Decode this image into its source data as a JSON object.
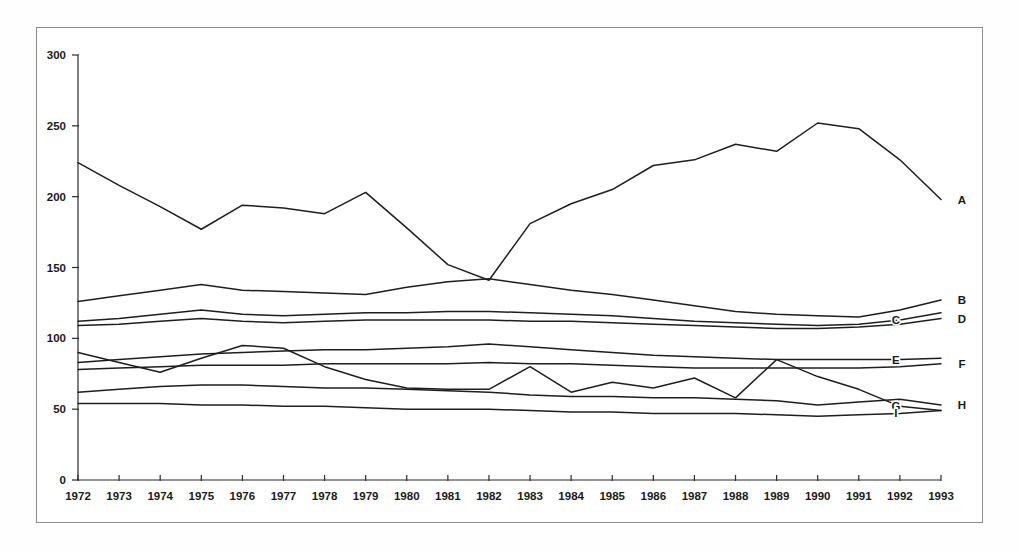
{
  "chart_data": {
    "type": "line",
    "title": "",
    "subtitle": "",
    "xlabel": "",
    "ylabel": "",
    "xlim": [
      1972,
      1993
    ],
    "ylim": [
      0,
      300
    ],
    "grid": false,
    "legend_position": "right-inline",
    "x": [
      1972,
      1973,
      1974,
      1975,
      1976,
      1977,
      1978,
      1979,
      1980,
      1981,
      1982,
      1983,
      1984,
      1985,
      1986,
      1987,
      1988,
      1989,
      1990,
      1991,
      1992,
      1993
    ],
    "xtick_labels": [
      "1972",
      "1973",
      "1974",
      "1975",
      "1976",
      "1977",
      "1978",
      "1979",
      "1980",
      "1981",
      "1982",
      "1983",
      "1984",
      "1985",
      "1986",
      "1987",
      "1988",
      "1989",
      "1990",
      "1991",
      "1992",
      "1993"
    ],
    "ytick_labels": [
      "0",
      "50",
      "100",
      "150",
      "200",
      "250",
      "300"
    ],
    "yticks": [
      0,
      50,
      100,
      150,
      200,
      250,
      300
    ],
    "series": [
      {
        "name": "A",
        "label": "A",
        "label_position": "right-outside",
        "values": [
          224,
          208,
          193,
          177,
          194,
          192,
          188,
          203,
          178,
          152,
          141,
          181,
          195,
          205,
          222,
          226,
          237,
          232,
          252,
          248,
          226,
          198
        ]
      },
      {
        "name": "B",
        "label": "B",
        "label_position": "right-outside",
        "values": [
          126,
          130,
          134,
          138,
          134,
          133,
          132,
          131,
          136,
          140,
          142,
          138,
          134,
          131,
          127,
          123,
          119,
          117,
          116,
          115,
          120,
          127
        ]
      },
      {
        "name": "C",
        "label": "C",
        "label_position": "inline",
        "values": [
          112,
          114,
          117,
          120,
          117,
          116,
          117,
          118,
          118,
          119,
          119,
          118,
          117,
          116,
          114,
          112,
          111,
          110,
          109,
          110,
          113,
          118
        ]
      },
      {
        "name": "D",
        "label": "D",
        "label_position": "right-outside",
        "values": [
          109,
          110,
          112,
          114,
          112,
          111,
          112,
          113,
          113,
          113,
          113,
          112,
          112,
          111,
          110,
          109,
          108,
          107,
          107,
          108,
          110,
          114
        ]
      },
      {
        "name": "E",
        "label": "E",
        "label_position": "inline",
        "values": [
          83,
          85,
          87,
          89,
          90,
          91,
          92,
          92,
          93,
          94,
          96,
          94,
          92,
          90,
          88,
          87,
          86,
          85,
          85,
          85,
          85,
          86
        ]
      },
      {
        "name": "F",
        "label": "F",
        "label_position": "right-outside",
        "values": [
          78,
          79,
          80,
          81,
          81,
          81,
          82,
          82,
          82,
          82,
          83,
          82,
          82,
          81,
          80,
          79,
          79,
          79,
          79,
          79,
          80,
          82
        ]
      },
      {
        "name": "G",
        "label": "G",
        "label_position": "inline",
        "values": [
          90,
          83,
          76,
          86,
          95,
          93,
          80,
          71,
          65,
          64,
          64,
          80,
          62,
          69,
          65,
          72,
          58,
          85,
          73,
          64,
          52,
          49
        ]
      },
      {
        "name": "H",
        "label": "H",
        "label_position": "right-outside",
        "values": [
          62,
          64,
          66,
          67,
          67,
          66,
          65,
          65,
          64,
          63,
          62,
          60,
          59,
          59,
          58,
          58,
          57,
          56,
          53,
          55,
          57,
          53
        ]
      },
      {
        "name": "I",
        "label": "I",
        "label_position": "inline",
        "values": [
          54,
          54,
          54,
          53,
          53,
          52,
          52,
          51,
          50,
          50,
          50,
          49,
          48,
          48,
          47,
          47,
          47,
          46,
          45,
          46,
          47,
          49
        ]
      }
    ]
  }
}
